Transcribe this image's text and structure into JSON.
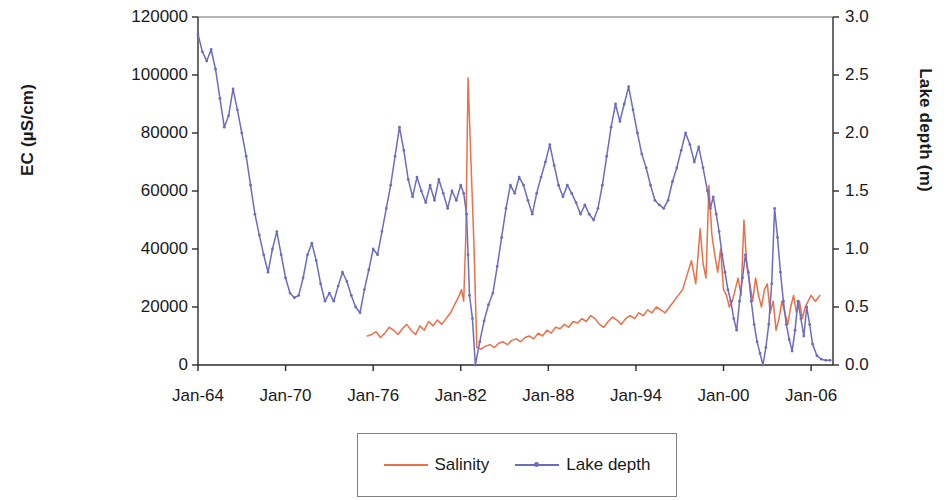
{
  "chart_data": {
    "type": "line",
    "title": "",
    "xlabel": "",
    "ylabel": "EC (µS/cm)",
    "y2label": "Lake depth (m)",
    "grid": false,
    "legend_position": "bottom-center",
    "x_tick_labels": [
      "Jan-64",
      "Jan-70",
      "Jan-76",
      "Jan-82",
      "Jan-88",
      "Jan-94",
      "Jan-00",
      "Jan-06"
    ],
    "x_tick_years": [
      1964,
      1970,
      1976,
      1982,
      1988,
      1994,
      2000,
      2006
    ],
    "xlim": [
      1964,
      2007.5
    ],
    "y_tick_labels": [
      "0",
      "20000",
      "40000",
      "60000",
      "80000",
      "100000",
      "120000"
    ],
    "y_tick_values": [
      0,
      20000,
      40000,
      60000,
      80000,
      100000,
      120000
    ],
    "ylim": [
      0,
      120000
    ],
    "y2_tick_labels": [
      "0.0",
      "0.5",
      "1.0",
      "1.5",
      "2.0",
      "2.5",
      "3.0"
    ],
    "y2_tick_values": [
      0.0,
      0.5,
      1.0,
      1.5,
      2.0,
      2.5,
      3.0
    ],
    "y2lim": [
      0.0,
      3.0
    ],
    "series": [
      {
        "name": "Salinity",
        "axis": "left",
        "unit": "µS/cm",
        "color": "#E8714A",
        "markers": false,
        "x": [
          1975.6,
          1975.9,
          1976.2,
          1976.5,
          1976.8,
          1977.1,
          1977.4,
          1977.7,
          1978.0,
          1978.3,
          1978.6,
          1978.9,
          1979.2,
          1979.5,
          1979.8,
          1980.1,
          1980.4,
          1980.7,
          1981.0,
          1981.3,
          1981.6,
          1981.9,
          1982.05,
          1982.2,
          1982.35,
          1982.5,
          1982.7,
          1982.9,
          1983.1,
          1983.4,
          1983.7,
          1984.0,
          1984.3,
          1984.6,
          1984.9,
          1985.2,
          1985.5,
          1985.8,
          1986.1,
          1986.4,
          1986.7,
          1987.0,
          1987.3,
          1987.6,
          1987.9,
          1988.2,
          1988.5,
          1988.8,
          1989.1,
          1989.4,
          1989.7,
          1990.0,
          1990.3,
          1990.6,
          1990.9,
          1991.2,
          1991.5,
          1991.8,
          1992.1,
          1992.4,
          1992.7,
          1993.0,
          1993.3,
          1993.6,
          1993.9,
          1994.2,
          1994.5,
          1994.8,
          1995.1,
          1995.4,
          1995.7,
          1996.0,
          1996.3,
          1996.6,
          1996.9,
          1997.2,
          1997.5,
          1997.8,
          1998.1,
          1998.4,
          1998.6,
          1998.8,
          1999.0,
          1999.2,
          1999.4,
          1999.6,
          1999.8,
          2000.0,
          2000.2,
          2000.4,
          2000.6,
          2000.8,
          2001.0,
          2001.2,
          2001.4,
          2001.6,
          2001.8,
          2002.0,
          2002.2,
          2002.4,
          2002.6,
          2002.8,
          2003.0,
          2003.2,
          2003.4,
          2003.6,
          2003.8,
          2004.0,
          2004.2,
          2004.4,
          2004.6,
          2004.8,
          2005.0,
          2005.2,
          2005.4,
          2005.6,
          2005.8,
          2006.0,
          2006.3,
          2006.6
        ],
        "values": [
          10000,
          10500,
          11500,
          9500,
          11000,
          13000,
          12000,
          10500,
          12500,
          14000,
          12000,
          10500,
          13500,
          12000,
          15000,
          13500,
          15500,
          14000,
          16000,
          18000,
          21000,
          24000,
          26000,
          22000,
          45000,
          99000,
          70000,
          42000,
          6000,
          5500,
          6500,
          7000,
          6000,
          7500,
          8000,
          7000,
          8500,
          9000,
          8000,
          9500,
          10000,
          9000,
          11000,
          10000,
          12000,
          11000,
          13000,
          12500,
          14000,
          13000,
          15000,
          14500,
          16000,
          15000,
          17000,
          16000,
          14000,
          13000,
          15000,
          16500,
          15500,
          14000,
          16000,
          17000,
          16000,
          18000,
          17000,
          19000,
          18000,
          20000,
          19000,
          18000,
          20000,
          22000,
          24000,
          26000,
          31000,
          36000,
          28000,
          47000,
          35000,
          30000,
          62000,
          45000,
          38000,
          32000,
          40000,
          26000,
          24000,
          20000,
          22000,
          26000,
          30000,
          24000,
          50000,
          34000,
          28000,
          22000,
          30000,
          24000,
          20000,
          26000,
          28000,
          18000,
          22000,
          12000,
          16000,
          22000,
          18000,
          14000,
          20000,
          24000,
          18000,
          22000,
          16000,
          20000,
          22000,
          24000,
          22000,
          24000
        ]
      },
      {
        "name": "Lake depth",
        "axis": "right",
        "unit": "m",
        "color": "#6C6CC0",
        "markers": true,
        "x": [
          1964.0,
          1964.3,
          1964.6,
          1964.9,
          1965.2,
          1965.5,
          1965.8,
          1966.1,
          1966.4,
          1966.7,
          1967.0,
          1967.3,
          1967.6,
          1967.9,
          1968.2,
          1968.5,
          1968.8,
          1969.1,
          1969.4,
          1969.7,
          1970.0,
          1970.3,
          1970.6,
          1970.9,
          1971.2,
          1971.5,
          1971.8,
          1972.1,
          1972.4,
          1972.7,
          1973.0,
          1973.3,
          1973.6,
          1973.9,
          1974.2,
          1974.5,
          1974.8,
          1975.1,
          1975.4,
          1975.7,
          1976.0,
          1976.3,
          1976.6,
          1976.9,
          1977.2,
          1977.5,
          1977.8,
          1978.1,
          1978.4,
          1978.7,
          1979.0,
          1979.3,
          1979.6,
          1979.9,
          1980.2,
          1980.5,
          1980.8,
          1981.1,
          1981.4,
          1981.7,
          1982.0,
          1982.2,
          1982.4,
          1982.5,
          1982.6,
          1982.8,
          1983.0,
          1983.3,
          1983.6,
          1983.9,
          1984.2,
          1984.5,
          1984.8,
          1985.1,
          1985.4,
          1985.7,
          1986.0,
          1986.3,
          1986.6,
          1986.9,
          1987.2,
          1987.5,
          1987.8,
          1988.1,
          1988.4,
          1988.7,
          1989.0,
          1989.3,
          1989.6,
          1989.9,
          1990.2,
          1990.5,
          1990.8,
          1991.1,
          1991.4,
          1991.7,
          1992.0,
          1992.3,
          1992.6,
          1992.9,
          1993.2,
          1993.5,
          1993.8,
          1994.1,
          1994.4,
          1994.7,
          1995.0,
          1995.3,
          1995.6,
          1995.9,
          1996.2,
          1996.5,
          1996.8,
          1997.1,
          1997.4,
          1997.7,
          1998.0,
          1998.3,
          1998.6,
          1998.9,
          1999.1,
          1999.3,
          1999.5,
          1999.7,
          1999.9,
          2000.1,
          2000.3,
          2000.5,
          2000.7,
          2000.9,
          2001.1,
          2001.3,
          2001.5,
          2001.7,
          2001.9,
          2002.1,
          2002.3,
          2002.5,
          2002.7,
          2002.9,
          2003.1,
          2003.3,
          2003.5,
          2003.7,
          2003.9,
          2004.1,
          2004.3,
          2004.5,
          2004.7,
          2004.9,
          2005.1,
          2005.3,
          2005.5,
          2005.7,
          2005.9,
          2006.1,
          2006.4,
          2006.7,
          2007.0,
          2007.3
        ],
        "values": [
          2.85,
          2.7,
          2.62,
          2.72,
          2.55,
          2.3,
          2.05,
          2.15,
          2.38,
          2.2,
          2.0,
          1.8,
          1.55,
          1.3,
          1.12,
          0.95,
          0.8,
          1.0,
          1.15,
          0.95,
          0.75,
          0.62,
          0.58,
          0.6,
          0.75,
          0.95,
          1.05,
          0.9,
          0.7,
          0.55,
          0.62,
          0.55,
          0.68,
          0.8,
          0.72,
          0.6,
          0.5,
          0.45,
          0.65,
          0.82,
          1.0,
          0.95,
          1.15,
          1.35,
          1.55,
          1.8,
          2.05,
          1.85,
          1.6,
          1.45,
          1.62,
          1.5,
          1.4,
          1.55,
          1.42,
          1.6,
          1.48,
          1.35,
          1.5,
          1.42,
          1.55,
          1.48,
          1.3,
          0.95,
          0.6,
          0.4,
          0.0,
          0.2,
          0.38,
          0.52,
          0.62,
          0.85,
          1.1,
          1.35,
          1.55,
          1.48,
          1.62,
          1.55,
          1.42,
          1.3,
          1.48,
          1.62,
          1.75,
          1.9,
          1.72,
          1.55,
          1.45,
          1.55,
          1.48,
          1.4,
          1.3,
          1.38,
          1.3,
          1.25,
          1.35,
          1.55,
          1.8,
          2.05,
          2.25,
          2.1,
          2.25,
          2.4,
          2.2,
          2.0,
          1.82,
          1.7,
          1.55,
          1.42,
          1.38,
          1.35,
          1.42,
          1.58,
          1.7,
          1.85,
          2.0,
          1.9,
          1.75,
          1.88,
          1.7,
          1.5,
          1.35,
          1.45,
          1.3,
          1.15,
          0.95,
          0.8,
          0.65,
          0.55,
          0.4,
          0.3,
          0.55,
          0.75,
          0.95,
          0.8,
          0.55,
          0.35,
          0.2,
          0.1,
          0.0,
          0.15,
          0.35,
          0.7,
          1.35,
          1.1,
          0.8,
          0.55,
          0.35,
          0.22,
          0.12,
          0.3,
          0.55,
          0.4,
          0.25,
          0.5,
          0.35,
          0.18,
          0.08,
          0.05,
          0.04,
          0.04
        ]
      }
    ]
  },
  "axes": {
    "left_label": "EC (µS/cm)",
    "right_label": "Lake depth (m)"
  },
  "legend": {
    "items": [
      {
        "label": "Salinity",
        "color": "#E8714A",
        "marker": false
      },
      {
        "label": "Lake depth",
        "color": "#6C6CC0",
        "marker": true
      }
    ]
  }
}
